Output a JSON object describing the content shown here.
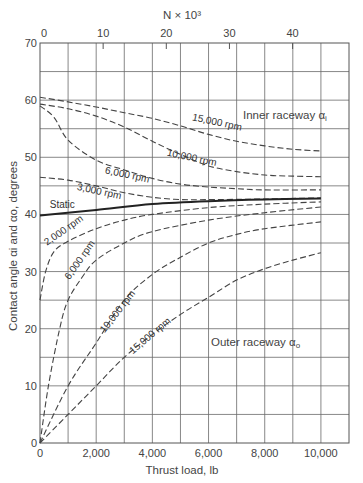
{
  "chart_data": {
    "type": "line",
    "title": "",
    "xlabel": "Thrust load, lb",
    "ylabel": "Contact angle αi and αo, degrees",
    "x2label": "N × 10³",
    "xlim": [
      0,
      11000
    ],
    "ylim": [
      0,
      70
    ],
    "grid": true,
    "x_ticks": [
      0,
      2000,
      4000,
      6000,
      8000,
      10000
    ],
    "x_tick_labels": [
      "0",
      "2,000",
      "4,000",
      "6,000",
      "8,000",
      "10,000"
    ],
    "x2_ticks_N_thousand": [
      0,
      10,
      20,
      30,
      40
    ],
    "y_ticks": [
      0,
      10,
      20,
      30,
      40,
      50,
      60,
      70
    ],
    "annotations": [
      "Inner raceway αi",
      "Outer raceway αo"
    ],
    "series": [
      {
        "name": "Inner 15,000 rpm",
        "group": "inner",
        "style": "dashed",
        "x": [
          0,
          1000,
          2000,
          3000,
          4000,
          5000,
          6000,
          7000,
          8000,
          9000,
          10000
        ],
        "y": [
          60.5,
          59.7,
          58.8,
          57.8,
          56.8,
          55.5,
          54.0,
          52.8,
          52.0,
          51.4,
          51.1
        ]
      },
      {
        "name": "Inner 10,000 rpm",
        "group": "inner",
        "style": "dashed",
        "x": [
          0,
          1000,
          2000,
          3000,
          4000,
          5000,
          6000,
          7000,
          8000,
          9000,
          10000
        ],
        "y": [
          59.3,
          58.5,
          57.2,
          55.3,
          52.8,
          50.5,
          48.5,
          47.5,
          46.9,
          46.7,
          46.6
        ]
      },
      {
        "name": "Inner 6,000 rpm",
        "group": "inner",
        "style": "dashed",
        "x": [
          0,
          500,
          1000,
          2000,
          3000,
          4000,
          5000,
          6000,
          7000,
          8000,
          10000
        ],
        "y": [
          59.0,
          57.0,
          53.0,
          49.5,
          47.8,
          46.3,
          45.3,
          44.8,
          44.5,
          44.3,
          44.3
        ]
      },
      {
        "name": "Inner 3,000 rpm",
        "group": "inner",
        "style": "dashed",
        "x": [
          0,
          1000,
          2000,
          3000,
          4000,
          5000,
          6000,
          8000,
          10000
        ],
        "y": [
          46.5,
          46.0,
          45.0,
          43.8,
          43.0,
          42.6,
          42.6,
          42.7,
          42.9
        ]
      },
      {
        "name": "Static",
        "group": "static",
        "style": "solid",
        "x": [
          0,
          2000,
          4000,
          6000,
          8000,
          10000
        ],
        "y": [
          39.8,
          40.8,
          41.8,
          42.3,
          42.6,
          42.8
        ]
      },
      {
        "name": "Outer 2,000 rpm",
        "group": "outer",
        "style": "dashed",
        "x": [
          0,
          200,
          500,
          1000,
          2000,
          3000,
          4000,
          6000,
          8000,
          10000
        ],
        "y": [
          25.0,
          30.0,
          33.5,
          35.3,
          37.5,
          39.0,
          40.0,
          41.2,
          41.8,
          42.2
        ]
      },
      {
        "name": "Outer 6,000 rpm",
        "group": "outer",
        "style": "dashed",
        "x": [
          0,
          300,
          700,
          1000,
          1500,
          2000,
          3000,
          4000,
          6000,
          8000,
          10000
        ],
        "y": [
          0,
          10,
          20,
          25,
          29,
          32,
          35,
          37,
          39,
          40.3,
          41.3
        ]
      },
      {
        "name": "Outer 10,000 rpm",
        "group": "outer",
        "style": "dashed",
        "x": [
          0,
          1000,
          2000,
          3000,
          4000,
          5000,
          6000,
          7000,
          8000,
          10000
        ],
        "y": [
          0,
          10,
          17.5,
          25,
          29.5,
          32.5,
          35,
          36.5,
          37.5,
          38.7
        ]
      },
      {
        "name": "Outer 15,000 rpm",
        "group": "outer",
        "style": "dashed",
        "x": [
          0,
          1000,
          2000,
          3000,
          4000,
          5000,
          6000,
          7000,
          8000,
          9000,
          10000
        ],
        "y": [
          0,
          5,
          10,
          15,
          19,
          22.5,
          25.5,
          28.5,
          30.5,
          32,
          33.3
        ]
      }
    ],
    "curve_labels": [
      {
        "text": "15,000 rpm",
        "x": 5400,
        "y": 56.5,
        "rot": 12
      },
      {
        "text": "10,000 rpm",
        "x": 4500,
        "y": 50.3,
        "rot": 12
      },
      {
        "text": "6,000 rpm",
        "x": 2300,
        "y": 47.2,
        "rot": 12
      },
      {
        "text": "3,000 rpm",
        "x": 1300,
        "y": 44.3,
        "rot": 12
      },
      {
        "text": "Static",
        "x": 350,
        "y": 41.2,
        "rot": 0
      },
      {
        "text": "2,000 rpm",
        "x": 250,
        "y": 34.5,
        "rot": -35
      },
      {
        "text": "6,000 rpm",
        "x": 1050,
        "y": 28.5,
        "rot": -55
      },
      {
        "text": "10,000 rpm",
        "x": 2300,
        "y": 19.2,
        "rot": -52
      },
      {
        "text": "15,000 rpm",
        "x": 3300,
        "y": 15.5,
        "rot": -40
      }
    ],
    "labels": {
      "inner": "Inner raceway α",
      "inner_sub": "i",
      "outer": "Outer raceway α",
      "outer_sub": "o"
    }
  }
}
